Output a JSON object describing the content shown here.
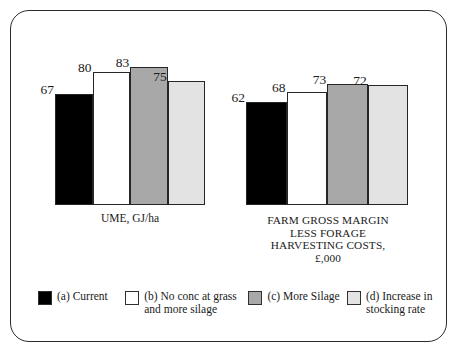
{
  "chart_data": {
    "type": "bar",
    "title": "",
    "subtitle": "",
    "xlabel": "",
    "ylabel": "",
    "grid": false,
    "legend_position": "bottom",
    "axis_visible": false,
    "ylim": [
      0,
      90
    ],
    "groups": [
      {
        "name": "UME, GJ/ha",
        "caption_lines": "UME, GJ/ha",
        "caption_style": "lower",
        "categories": [
          "(a) Current",
          "(b) No conc at grass and more silage",
          "(c) More Silage",
          "(d) Increase in stocking rate"
        ],
        "values": [
          67,
          80,
          83,
          75
        ],
        "value_labels": [
          "67",
          "80",
          "83",
          "75"
        ]
      },
      {
        "name": "FARM GROSS MARGIN LESS FORAGE HARVESTING COSTS, £,000",
        "caption_lines": "FARM GROSS MARGIN\nLESS FORAGE\nHARVESTING COSTS,\n£,000",
        "caption_style": "upper",
        "categories": [
          "(a) Current",
          "(b) No conc at grass and more silage",
          "(c) More Silage",
          "(d) Increase in stocking rate"
        ],
        "values": [
          62,
          68,
          73,
          72
        ],
        "value_labels": [
          "62",
          "68",
          "73",
          "72"
        ]
      }
    ],
    "series": [
      {
        "name": "(a) Current",
        "color": "#000000",
        "values": [
          67,
          62
        ]
      },
      {
        "name": "(b) No conc at grass and more silage",
        "color": "#ffffff",
        "values": [
          80,
          68
        ]
      },
      {
        "name": "(c) More Silage",
        "color": "#a8a8a8",
        "values": [
          83,
          73
        ]
      },
      {
        "name": "(d) Increase in stocking rate",
        "color": "#e3e3e3",
        "values": [
          75,
          72
        ]
      }
    ]
  },
  "legend": {
    "items": [
      {
        "label": "(a) Current",
        "color": "#000000"
      },
      {
        "label": "(b) No conc at grass\nand more silage",
        "color": "#ffffff"
      },
      {
        "label": "(c) More Silage",
        "color": "#a8a8a8"
      },
      {
        "label": "(d) Increase in\nstocking rate",
        "color": "#e3e3e3"
      }
    ]
  },
  "frame": {
    "border_color": "#2b2b2b",
    "background": "#ffffff"
  }
}
